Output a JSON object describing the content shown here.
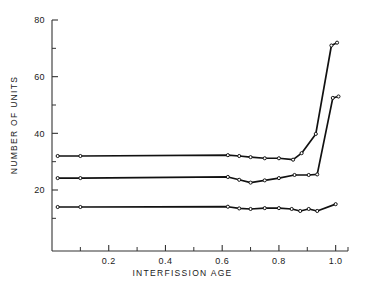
{
  "chart_data": {
    "type": "line",
    "title": "",
    "xlabel": "INTERFISSION   AGE",
    "ylabel": "NUMBER  OF  UNITS",
    "xlim": [
      0.0,
      1.04
    ],
    "ylim": [
      5,
      80
    ],
    "grid": false,
    "legend": null,
    "x_major_ticks": [
      0.2,
      0.4,
      0.6,
      0.8,
      1.0
    ],
    "x_major_tick_labels": [
      "0.2",
      "0.4",
      "0.6",
      "0.8",
      "1.0"
    ],
    "x_minor_ticks": [
      0.1,
      0.3,
      0.5,
      0.7,
      0.9
    ],
    "y_major_ticks": [
      20,
      40,
      60,
      80
    ],
    "y_major_tick_labels": [
      "20",
      "40",
      "60",
      "80"
    ],
    "y_minor_ticks": [
      10,
      30,
      50,
      70
    ],
    "marker": "open-circle",
    "series": [
      {
        "name": "upper",
        "color": "#111111",
        "points": [
          [
            0.02,
            32.0
          ],
          [
            0.1,
            32.0
          ],
          [
            0.62,
            32.3
          ],
          [
            0.66,
            32.0
          ],
          [
            0.7,
            31.6
          ],
          [
            0.75,
            31.2
          ],
          [
            0.8,
            31.2
          ],
          [
            0.85,
            30.7
          ],
          [
            0.88,
            33.0
          ],
          [
            0.93,
            39.8
          ],
          [
            0.985,
            71.0
          ],
          [
            1.005,
            72.0
          ]
        ]
      },
      {
        "name": "middle",
        "color": "#111111",
        "points": [
          [
            0.02,
            24.2
          ],
          [
            0.1,
            24.2
          ],
          [
            0.62,
            24.6
          ],
          [
            0.66,
            23.6
          ],
          [
            0.7,
            22.6
          ],
          [
            0.75,
            23.4
          ],
          [
            0.8,
            24.2
          ],
          [
            0.855,
            25.3
          ],
          [
            0.905,
            25.3
          ],
          [
            0.935,
            25.5
          ],
          [
            0.99,
            52.5
          ],
          [
            1.01,
            53.0
          ]
        ]
      },
      {
        "name": "lower",
        "color": "#111111",
        "points": [
          [
            0.02,
            14.0
          ],
          [
            0.1,
            14.0
          ],
          [
            0.62,
            14.1
          ],
          [
            0.66,
            13.5
          ],
          [
            0.7,
            13.3
          ],
          [
            0.75,
            13.6
          ],
          [
            0.8,
            13.6
          ],
          [
            0.845,
            13.3
          ],
          [
            0.875,
            12.6
          ],
          [
            0.905,
            13.3
          ],
          [
            0.935,
            12.6
          ],
          [
            1.0,
            15.0
          ]
        ]
      }
    ]
  },
  "axes": {
    "x_axis_name": "interfission-age-axis",
    "y_axis_name": "number-of-units-axis"
  }
}
